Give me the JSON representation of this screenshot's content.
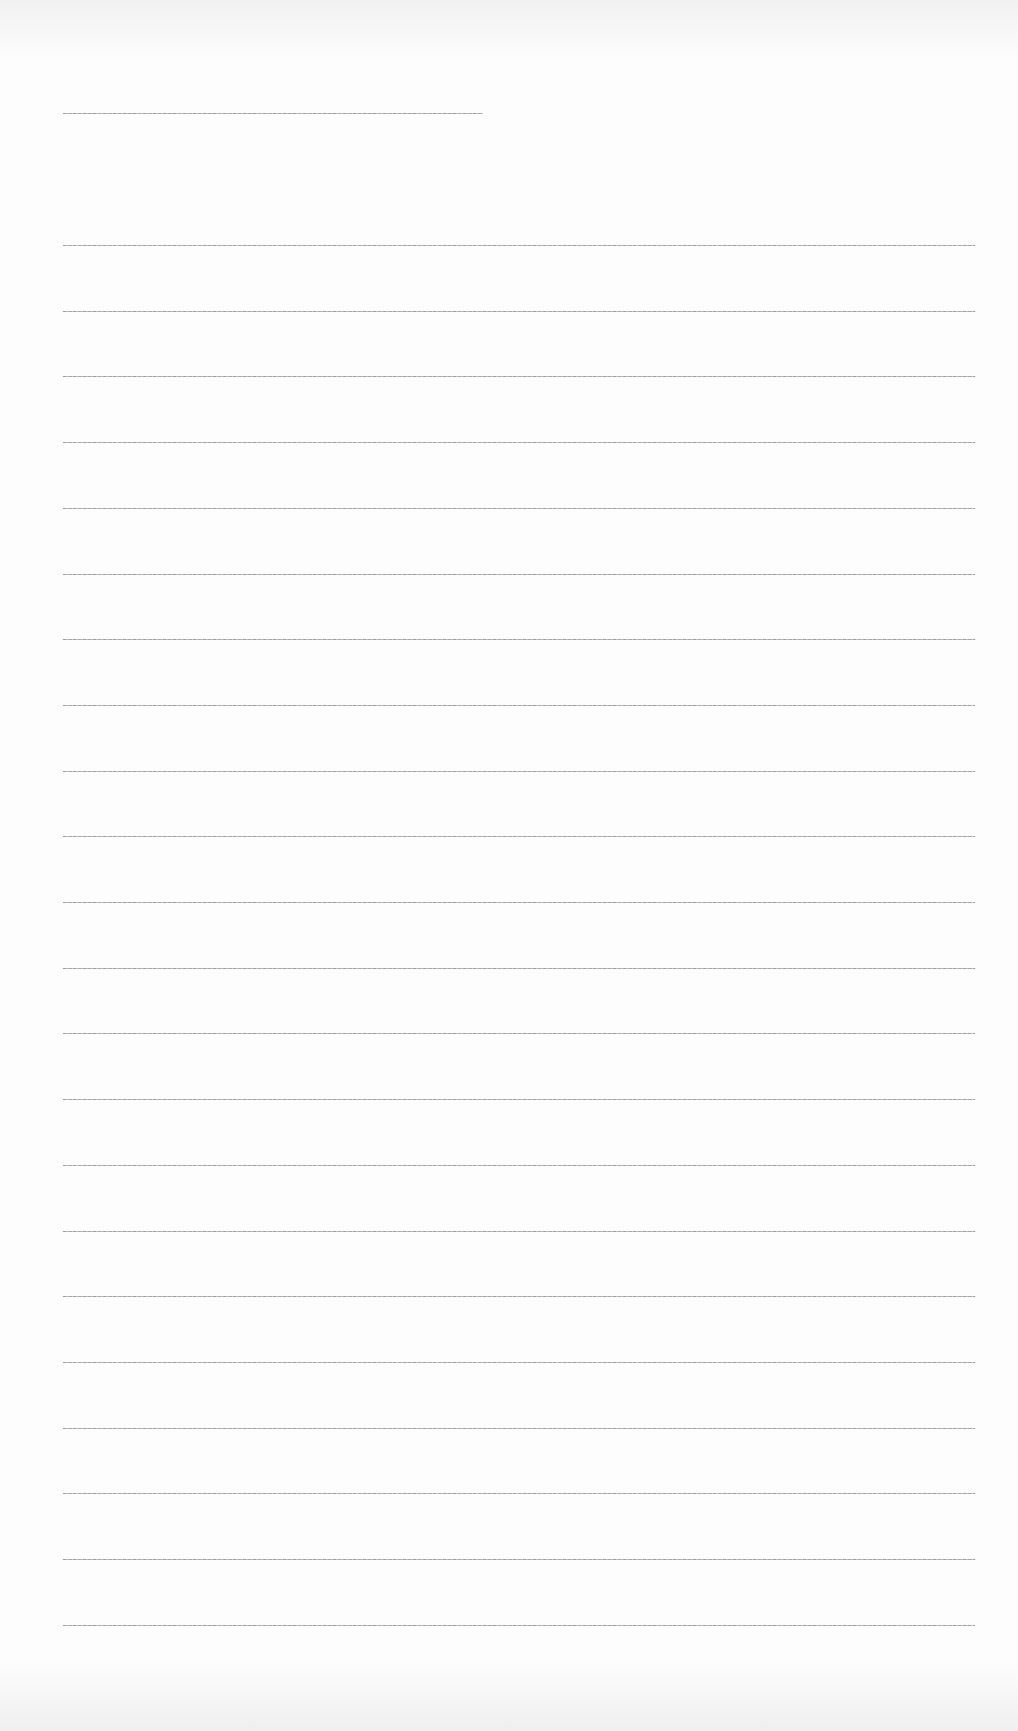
{
  "page": {
    "type": "blank lined writing sheet",
    "background": "#fdfdfd",
    "line_color": "#9a9a9a"
  },
  "header_rule": {
    "x": 63,
    "y": 113,
    "width": 420
  },
  "ruled_lines": {
    "count": 22,
    "x": 63,
    "width": 912,
    "first_y": 245,
    "spacing": 65.7
  }
}
